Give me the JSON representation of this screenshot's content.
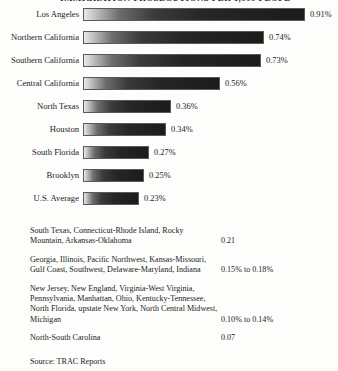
{
  "title_partial": "IMMIGRATION PROSECUTIONS PER 1,000 PEOPLE",
  "chart_data": {
    "type": "bar",
    "title": "",
    "xlabel": "",
    "ylabel": "",
    "orientation": "horizontal",
    "grid": false,
    "legend": "none",
    "xlim": [
      0,
      0.91
    ],
    "unit": "%",
    "categories": [
      "Los Angeles",
      "Northern California",
      "Southern California",
      "Central California",
      "North Texas",
      "Houston",
      "South Florida",
      "Brooklyn",
      "U.S. Average"
    ],
    "values": [
      0.91,
      0.74,
      0.73,
      0.56,
      0.36,
      0.34,
      0.27,
      0.25,
      0.23
    ],
    "value_labels": [
      "0.91%",
      "0.74%",
      "0.73%",
      "0.56%",
      "0.36%",
      "0.34%",
      "0.27%",
      "0.25%",
      "0.23%"
    ]
  },
  "bars": [
    {
      "label": "Los Angeles",
      "value_label": "0.91%",
      "width_px": 222
    },
    {
      "label": "Northern California",
      "value_label": "0.74%",
      "width_px": 181
    },
    {
      "label": "Southern California",
      "value_label": "0.73%",
      "width_px": 178
    },
    {
      "label": "Central California",
      "value_label": "0.56%",
      "width_px": 137
    },
    {
      "label": "North Texas",
      "value_label": "0.36%",
      "width_px": 88
    },
    {
      "label": "Houston",
      "value_label": "0.34%",
      "width_px": 83
    },
    {
      "label": "South Florida",
      "value_label": "0.27%",
      "width_px": 66
    },
    {
      "label": "Brooklyn",
      "value_label": "0.25%",
      "width_px": 61
    },
    {
      "label": "U.S. Average",
      "value_label": "0.23%",
      "width_px": 56
    }
  ],
  "notes": [
    {
      "names": "South Texas, Connecticut-Rhode Island, Rocky Mountain, Arkansas-Oklahoma",
      "value": "0.21",
      "value_offset_lines": 1
    },
    {
      "names": "Georgia, Illinois, Pacific Northwest, Kansas-Missouri, Gulf Coast, Southwest, Delaware-Maryland, Indiana",
      "value": "0.15% to 0.18%",
      "value_offset_lines": 1
    },
    {
      "names": "New Jersey, New England, Virginia-West Virginia, Pennsylvania, Manhattan, Ohio, Kentucky-Tennessee, North Florida, upstate New York, North Central Midwest, Michigan",
      "value": "0.10% to 0.14%",
      "value_offset_lines": 3
    },
    {
      "names": "North-South Carolina",
      "value": "0.07",
      "value_offset_lines": 0
    }
  ],
  "source": "Source: TRAC Reports"
}
